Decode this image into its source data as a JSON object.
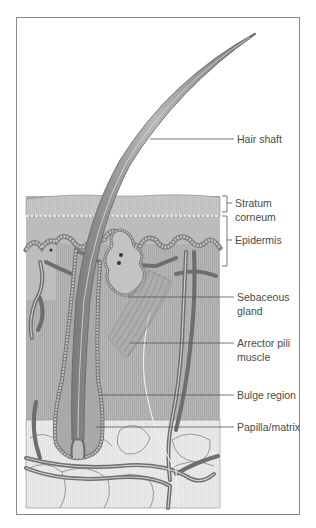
{
  "figure": {
    "labels": [
      {
        "id": "hair-shaft",
        "lines": [
          "Hair shaft"
        ]
      },
      {
        "id": "stratum-corneum",
        "lines": [
          "Stratum",
          "corneum"
        ]
      },
      {
        "id": "epidermis",
        "lines": [
          "Epidermis"
        ]
      },
      {
        "id": "sebaceous-gland",
        "lines": [
          "Sebaceous",
          "gland"
        ]
      },
      {
        "id": "arrector-pili-muscle",
        "lines": [
          "Arrector pili",
          "muscle"
        ]
      },
      {
        "id": "bulge-region",
        "lines": [
          "Bulge region"
        ]
      },
      {
        "id": "papilla-matrix",
        "lines": [
          "Papilla/matrix"
        ]
      }
    ],
    "colors": {
      "hair": "#8c8c8c",
      "stratum": "#c9c9c9",
      "epidermis": "#bdbdbd",
      "dermis": "#b3b3b3",
      "fat": "#e9e9e9",
      "vessel": "#7a7a7a",
      "line": "#555555",
      "text": "#4a4a4a"
    }
  }
}
